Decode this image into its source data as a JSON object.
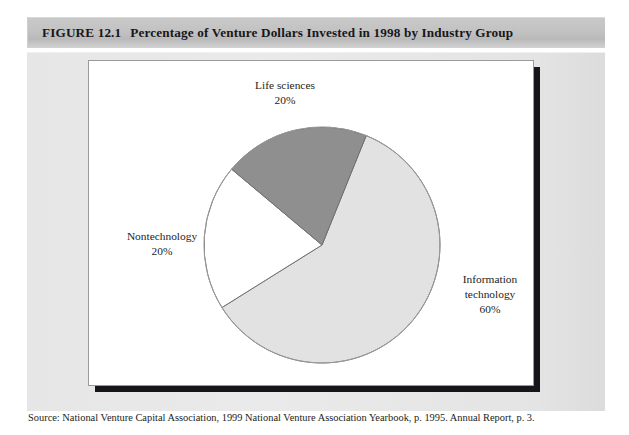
{
  "figure": {
    "number": "FIGURE 12.1",
    "title": "Percentage of Venture Dollars Invested in 1998 by Industry Group",
    "source": "Source: National Venture Capital Association, 1999 National Venture Association Yearbook, p. 1995. Annual Report, p. 3."
  },
  "labels": {
    "life_sciences_name": "Life sciences",
    "life_sciences_pct": "20%",
    "nontechnology_name": "Nontechnology",
    "nontechnology_pct": "20%",
    "information_technology_name_line1": "Information",
    "information_technology_name_line2": "technology",
    "information_technology_pct": "60%"
  },
  "chart_data": {
    "type": "pie",
    "title": "Percentage of Venture Dollars Invested in 1998 by Industry Group",
    "categories": [
      "Information technology",
      "Life sciences",
      "Nontechnology"
    ],
    "values": [
      60,
      20,
      20
    ],
    "unit": "percent",
    "labels": [
      "60%",
      "20%",
      "20%"
    ],
    "colors": [
      "#e2e2e2",
      "#ffffff",
      "#8f8f8f"
    ],
    "start_angle_deg": 22,
    "direction": "clockwise",
    "legend": "none",
    "label_placement": "outside-callout",
    "grid": false
  },
  "colors": {
    "information_technology": "#e2e2e2",
    "life_sciences": "#ffffff",
    "nontechnology": "#8f8f8f",
    "slice_outline": "#6f6f6f",
    "panel_background": "#ffffff",
    "panel_border": "#9a9a9a",
    "panel_shadow": "#15151a",
    "body_background": "#e6e6e6",
    "title_band": "#c2c2c2",
    "text": "#1d1d20"
  }
}
